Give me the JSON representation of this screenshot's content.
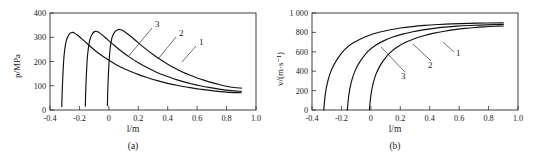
{
  "figure": {
    "background_color": "#ffffff",
    "line_color": "#111111",
    "panels": [
      "(a)",
      "(b)"
    ]
  },
  "chart_data": [
    {
      "type": "line",
      "panel": "(a)",
      "caption": "(a)",
      "title": "",
      "xlabel": "l/m",
      "ylabel": "p/MPa",
      "xlim": [
        -0.4,
        1.0
      ],
      "ylim": [
        0,
        400
      ],
      "xticks": [
        -0.4,
        -0.2,
        0,
        0.2,
        0.4,
        0.6,
        0.8,
        1.0
      ],
      "xticklabels": [
        "-0.4",
        "-0.2",
        "0",
        "0.2",
        "0.4",
        "0.6",
        "0.8",
        "1.0"
      ],
      "yticks": [
        0,
        100,
        200,
        300,
        400
      ],
      "yticklabels": [
        "0",
        "100",
        "200",
        "300",
        "400"
      ],
      "grid": false,
      "legend_position": "inline-curve-labels",
      "series": [
        {
          "name": "1",
          "label": "1",
          "x": [
            -0.01,
            -0.005,
            0.005,
            0.02,
            0.04,
            0.06,
            0.075,
            0.09,
            0.11,
            0.15,
            0.2,
            0.25,
            0.3,
            0.35,
            0.4,
            0.45,
            0.5,
            0.55,
            0.6,
            0.65,
            0.7,
            0.75,
            0.8,
            0.85,
            0.9
          ],
          "y": [
            18,
            120,
            230,
            295,
            322,
            331,
            332,
            329,
            322,
            303,
            277,
            252,
            229,
            208,
            189,
            172,
            157,
            144,
            132,
            122,
            113,
            105,
            98,
            93,
            90
          ]
        },
        {
          "name": "2",
          "label": "2",
          "x": [
            -0.16,
            -0.155,
            -0.145,
            -0.13,
            -0.11,
            -0.095,
            -0.085,
            -0.07,
            -0.05,
            -0.01,
            0.04,
            0.09,
            0.14,
            0.2,
            0.26,
            0.32,
            0.38,
            0.44,
            0.5,
            0.56,
            0.62,
            0.69,
            0.76,
            0.83,
            0.9
          ],
          "y": [
            16,
            115,
            225,
            288,
            316,
            324,
            325,
            321,
            312,
            291,
            265,
            240,
            218,
            195,
            175,
            157,
            142,
            129,
            118,
            108,
            100,
            92,
            85,
            80,
            77
          ]
        },
        {
          "name": "3",
          "label": "3",
          "x": [
            -0.32,
            -0.315,
            -0.305,
            -0.29,
            -0.27,
            -0.255,
            -0.245,
            -0.23,
            -0.21,
            -0.17,
            -0.12,
            -0.07,
            -0.01,
            0.05,
            0.12,
            0.19,
            0.26,
            0.33,
            0.4,
            0.47,
            0.55,
            0.63,
            0.71,
            0.8,
            0.9
          ],
          "y": [
            14,
            110,
            220,
            284,
            312,
            319,
            320,
            316,
            307,
            286,
            259,
            234,
            209,
            187,
            166,
            149,
            134,
            121,
            110,
            101,
            92,
            85,
            79,
            74,
            71
          ]
        }
      ]
    },
    {
      "type": "line",
      "panel": "(b)",
      "caption": "(b)",
      "title": "",
      "xlabel": "l/m",
      "ylabel": "v/(m·s⁻¹)",
      "xlim": [
        -0.4,
        1.0
      ],
      "ylim": [
        0,
        1000
      ],
      "xticks": [
        -0.4,
        -0.2,
        0,
        0.2,
        0.4,
        0.6,
        0.8,
        1.0
      ],
      "xticklabels": [
        "-0.4",
        "-0.2",
        "0",
        "0.2",
        "0.4",
        "0.6",
        "0.8",
        "1.0"
      ],
      "yticks": [
        0,
        200,
        400,
        600,
        800,
        1000
      ],
      "yticklabels": [
        "0",
        "200",
        "400",
        "600",
        "800",
        "1 000"
      ],
      "grid": false,
      "legend_position": "inline-curve-labels",
      "series": [
        {
          "name": "1",
          "label": "1",
          "x": [
            -0.01,
            0.0,
            0.015,
            0.035,
            0.06,
            0.09,
            0.13,
            0.18,
            0.24,
            0.3,
            0.36,
            0.43,
            0.5,
            0.57,
            0.64,
            0.71,
            0.78,
            0.845,
            0.9
          ],
          "y": [
            0,
            150,
            270,
            370,
            450,
            520,
            592,
            650,
            700,
            737,
            766,
            792,
            812,
            828,
            841,
            851,
            858,
            863,
            866
          ]
        },
        {
          "name": "2",
          "label": "2",
          "x": [
            -0.16,
            -0.15,
            -0.135,
            -0.115,
            -0.09,
            -0.06,
            -0.02,
            0.03,
            0.09,
            0.15,
            0.215,
            0.285,
            0.355,
            0.43,
            0.505,
            0.585,
            0.665,
            0.785,
            0.9
          ],
          "y": [
            0,
            152,
            275,
            375,
            458,
            530,
            605,
            665,
            715,
            752,
            782,
            807,
            826,
            842,
            854,
            864,
            871,
            878,
            882
          ]
        },
        {
          "name": "3",
          "label": "3",
          "x": [
            -0.32,
            -0.31,
            -0.295,
            -0.275,
            -0.25,
            -0.22,
            -0.18,
            -0.13,
            -0.07,
            -0.01,
            0.055,
            0.125,
            0.2,
            0.28,
            0.365,
            0.455,
            0.55,
            0.72,
            0.9
          ],
          "y": [
            0,
            158,
            282,
            385,
            468,
            543,
            620,
            682,
            733,
            771,
            801,
            825,
            845,
            860,
            872,
            881,
            888,
            895,
            898
          ]
        }
      ]
    }
  ]
}
